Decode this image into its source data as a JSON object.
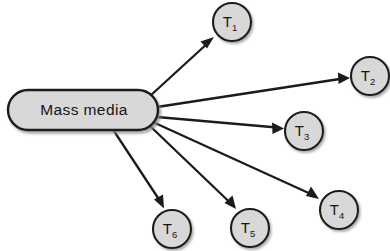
{
  "diagram": {
    "type": "radial-node-link",
    "background_color": "#ffffff",
    "node_fill_color": "#d8d8d8",
    "node_stroke_color": "#1b1b1b",
    "edge_color": "#1b1b1b",
    "hub": {
      "id": "mass-media",
      "label": "Mass media",
      "shape": "rounded-rectangle",
      "x": 8,
      "y": 90,
      "width": 150,
      "height": 40,
      "corner_radius": 20
    },
    "targets": [
      {
        "id": "t1",
        "label": "T",
        "subscript": "1",
        "cx": 232,
        "cy": 22,
        "r": 19
      },
      {
        "id": "t2",
        "label": "T",
        "subscript": "2",
        "cx": 370,
        "cy": 76,
        "r": 19
      },
      {
        "id": "t3",
        "label": "T",
        "subscript": "3",
        "cx": 304,
        "cy": 131,
        "r": 19
      },
      {
        "id": "t4",
        "label": "T",
        "subscript": "4",
        "cx": 339,
        "cy": 210,
        "r": 19
      },
      {
        "id": "t5",
        "label": "T",
        "subscript": "5",
        "cx": 250,
        "cy": 228,
        "r": 19
      },
      {
        "id": "t6",
        "label": "T",
        "subscript": "6",
        "cx": 172,
        "cy": 229,
        "r": 19
      }
    ],
    "edges": [
      {
        "id": "edge-t1",
        "from": "mass-media",
        "to": "t1",
        "x1": 150,
        "y1": 96,
        "x2": 214,
        "y2": 37,
        "arrowhead": "filled-triangle"
      },
      {
        "id": "edge-t2",
        "from": "mass-media",
        "to": "t2",
        "x1": 157,
        "y1": 107,
        "x2": 350,
        "y2": 78,
        "arrowhead": "filled-triangle"
      },
      {
        "id": "edge-t3",
        "from": "mass-media",
        "to": "t3",
        "x1": 157,
        "y1": 117,
        "x2": 284,
        "y2": 128,
        "arrowhead": "filled-triangle"
      },
      {
        "id": "edge-t4",
        "from": "mass-media",
        "to": "t4",
        "x1": 155,
        "y1": 123,
        "x2": 319,
        "y2": 199,
        "arrowhead": "filled-triangle"
      },
      {
        "id": "edge-t5",
        "from": "mass-media",
        "to": "t5",
        "x1": 150,
        "y1": 126,
        "x2": 236,
        "y2": 209,
        "arrowhead": "filled-triangle"
      },
      {
        "id": "edge-t6",
        "from": "mass-media",
        "to": "t6",
        "x1": 112,
        "y1": 128,
        "x2": 164,
        "y2": 208,
        "arrowhead": "filled-triangle"
      }
    ]
  }
}
